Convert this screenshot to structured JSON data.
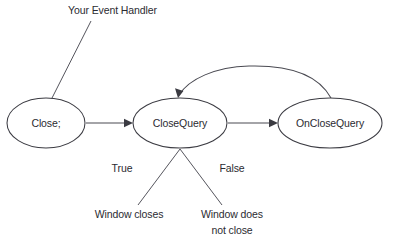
{
  "diagram": {
    "background_color": "#ffffff",
    "line_color": "#4a4a52",
    "text_color": "#2b2b31",
    "nodes": [
      {
        "id": "close",
        "label": "Close;",
        "cx": 46,
        "cy": 123,
        "rx": 39,
        "ry": 25
      },
      {
        "id": "closequery",
        "label": "CloseQuery",
        "cx": 180,
        "cy": 123,
        "rx": 47,
        "ry": 25
      },
      {
        "id": "onclosequery",
        "label": "OnCloseQuery",
        "cx": 330,
        "cy": 123,
        "rx": 52,
        "ry": 25
      }
    ],
    "annotations": [
      {
        "id": "event-handler",
        "label": "Your Event Handler",
        "x": 68,
        "y": 14
      },
      {
        "id": "true-branch",
        "label": "True",
        "x": 122,
        "y": 172
      },
      {
        "id": "false-branch",
        "label": "False",
        "x": 232,
        "y": 172
      },
      {
        "id": "window-closes",
        "label": "Window closes",
        "x": 129,
        "y": 218
      },
      {
        "id": "window-not-close-line1",
        "label": "Window does",
        "x": 232,
        "y": 218
      },
      {
        "id": "window-not-close-line2",
        "label": "not close",
        "x": 232,
        "y": 234
      }
    ],
    "edges": [
      {
        "id": "close-to-closequery",
        "from": "close",
        "to": "closequery",
        "style": "straight-arrow"
      },
      {
        "id": "closequery-to-onclosequery",
        "from": "closequery",
        "to": "onclosequery",
        "style": "straight-arrow"
      },
      {
        "id": "onclosequery-to-closequery",
        "from": "onclosequery",
        "to": "closequery",
        "style": "curved-arrow-back"
      },
      {
        "id": "closequery-true",
        "from": "closequery",
        "to": "window-closes",
        "style": "leader-line"
      },
      {
        "id": "closequery-false",
        "from": "closequery",
        "to": "window-not-close",
        "style": "leader-line"
      },
      {
        "id": "handler-leader",
        "from": "event-handler",
        "to": "close",
        "style": "leader-line"
      }
    ]
  }
}
